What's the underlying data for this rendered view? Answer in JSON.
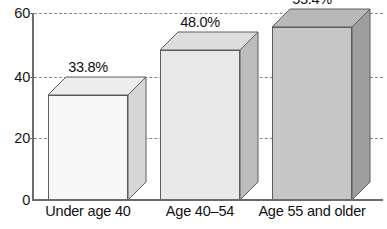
{
  "chart_data": {
    "type": "bar",
    "title": "",
    "subtitle": "",
    "xlabel": "",
    "ylabel": "",
    "categories": [
      "Under age 40",
      "Age 40–54",
      "Age 55 and older"
    ],
    "values": [
      33.8,
      48.0,
      55.4
    ],
    "data_labels": [
      "33.8%",
      "48.0%",
      "55.4%"
    ],
    "ylim": [
      0,
      60
    ],
    "ytick_labels": [
      "0",
      "20",
      "40",
      "60"
    ],
    "ytick_values": [
      0,
      20,
      40,
      60
    ],
    "grid": true,
    "grid_style": "dashed-horizontal",
    "legend": false,
    "legend_position": "none",
    "style": "3d-extruded-grayscale",
    "series": [
      {
        "name": "",
        "values": [
          33.8,
          48.0,
          55.4
        ]
      }
    ],
    "bar_colors": [
      "#f7f7f7",
      "#e8e8e8",
      "#c6c6c6"
    ],
    "bar_side_colors": [
      "#d6d6d6",
      "#bdbdbd",
      "#9e9e9e"
    ],
    "bar_top_colors": [
      "#ededed",
      "#dddddd",
      "#b8b8b8"
    ],
    "axis_color": "#6b6b6b",
    "grid_color": "#8a8a8a",
    "text_color": "#111111",
    "background": "#ffffff"
  },
  "axis": {
    "ticks": [
      {
        "label": "60",
        "value": 60
      },
      {
        "label": "40",
        "value": 40
      },
      {
        "label": "20",
        "value": 20
      },
      {
        "label": "0",
        "value": 0
      }
    ]
  },
  "bars": [
    {
      "category": "Under age 40",
      "label": "33.8%",
      "value": 33.8
    },
    {
      "category": "Age 40–54",
      "label": "48.0%",
      "value": 48.0
    },
    {
      "category": "Age 55 and older",
      "label": "55.4%",
      "value": 55.4
    }
  ]
}
